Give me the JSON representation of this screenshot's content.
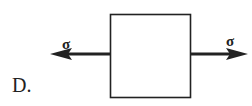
{
  "option_label": "D.",
  "diagram": {
    "element": "square-element",
    "stress_symbol_left": "σ",
    "stress_symbol_right": "σ",
    "stress_direction": "tensile (outward, horizontal)",
    "colors": {
      "stroke": "#222222",
      "background": "#ffffff"
    }
  }
}
